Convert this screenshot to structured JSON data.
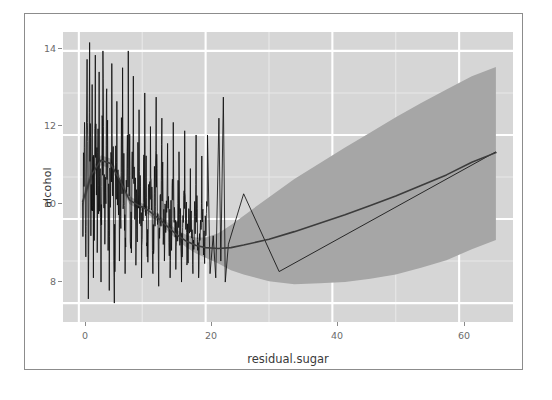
{
  "chart": {
    "axis_titles": {
      "x": "residual.sugar",
      "y": "alcohol"
    },
    "y_ticks": [
      "14",
      "12",
      "10",
      "8"
    ],
    "x_ticks": [
      "0",
      "20",
      "40",
      "60"
    ],
    "colors": {
      "panel_background": "#d6d6d6",
      "grid_major": "#ffffff",
      "grid_minor": "#e8e8e8",
      "data_line": "#111111",
      "smooth_line": "#3c3c3c",
      "confidence_band": "#a6a6a6",
      "axis_text": "#6b6b6b",
      "frame_border": "#8c8c8c"
    }
  },
  "chart_data": {
    "type": "line",
    "title": "",
    "subtitle": "",
    "xlabel": "residual.sugar",
    "ylabel": "alcohol",
    "xlim": [
      -2.5,
      68.5
    ],
    "ylim": [
      7.55,
      14.45
    ],
    "xticks": [
      0,
      20,
      40,
      60
    ],
    "yticks": [
      8,
      10,
      12,
      14
    ],
    "grid": true,
    "legend": "none",
    "annotations": [],
    "series": [
      {
        "name": "alcohol vs residual.sugar (observed, connected)",
        "type": "line",
        "color": "#111111",
        "note": "Dense high-frequency zigzag of ordered observations; amplitude 8.0-14.2 densely packed for residual.sugar 0-20, then sparse isolated spikes to 12.9 near 20-24, then a sparse path peaking 10.6 at x=26, dipping to 8.75 at x=32, then rising steadily to 11.6 at x=65.8",
        "points": [
          [
            0.6,
            10.4
          ],
          [
            0.9,
            12.3
          ],
          [
            1.1,
            9.1
          ],
          [
            1.3,
            13.8
          ],
          [
            1.5,
            8.1
          ],
          [
            1.7,
            14.2
          ],
          [
            1.9,
            9.6
          ],
          [
            2.1,
            13.2
          ],
          [
            2.3,
            8.6
          ],
          [
            2.6,
            13.9
          ],
          [
            2.9,
            9.2
          ],
          [
            3.2,
            13.5
          ],
          [
            3.5,
            8.5
          ],
          [
            3.8,
            14.0
          ],
          [
            4.1,
            9.4
          ],
          [
            4.4,
            13.1
          ],
          [
            4.8,
            8.3
          ],
          [
            5.2,
            13.7
          ],
          [
            5.6,
            8.0
          ],
          [
            6.0,
            12.8
          ],
          [
            6.4,
            9.0
          ],
          [
            6.9,
            13.6
          ],
          [
            7.3,
            8.7
          ],
          [
            7.8,
            14.0
          ],
          [
            8.2,
            9.3
          ],
          [
            8.6,
            13.4
          ],
          [
            9.0,
            8.9
          ],
          [
            9.5,
            12.6
          ],
          [
            9.9,
            8.6
          ],
          [
            10.4,
            13.0
          ],
          [
            10.8,
            9.1
          ],
          [
            11.3,
            12.2
          ],
          [
            11.7,
            8.7
          ],
          [
            12.2,
            12.9
          ],
          [
            12.6,
            8.4
          ],
          [
            13.1,
            12.4
          ],
          [
            13.5,
            9.0
          ],
          [
            14.0,
            11.8
          ],
          [
            14.4,
            8.6
          ],
          [
            14.9,
            12.3
          ],
          [
            15.3,
            8.8
          ],
          [
            15.8,
            11.6
          ],
          [
            16.2,
            8.5
          ],
          [
            16.7,
            12.1
          ],
          [
            17.1,
            9.0
          ],
          [
            17.6,
            11.2
          ],
          [
            18.0,
            8.7
          ],
          [
            18.5,
            12.0
          ],
          [
            18.9,
            8.6
          ],
          [
            19.4,
            11.5
          ],
          [
            19.8,
            9.2
          ],
          [
            20.3,
            12.0
          ],
          [
            20.7,
            8.7
          ],
          [
            21.2,
            9.6
          ],
          [
            21.6,
            8.6
          ],
          [
            22.1,
            12.4
          ],
          [
            22.4,
            9.0
          ],
          [
            22.8,
            12.9
          ],
          [
            23.1,
            8.5
          ],
          [
            23.6,
            9.4
          ],
          [
            26.0,
            10.6
          ],
          [
            31.6,
            8.75
          ],
          [
            65.8,
            11.6
          ]
        ]
      },
      {
        "name": "LOESS smooth (fit)",
        "type": "line",
        "color": "#3c3c3c",
        "x": [
          0.6,
          2.0,
          3.5,
          5.0,
          6.5,
          8.0,
          9.5,
          11.0,
          12.5,
          14.0,
          15.5,
          17.0,
          18.5,
          20.0,
          22.0,
          24.0,
          26.0,
          30.0,
          34.0,
          38.0,
          42.0,
          46.0,
          50.0,
          54.0,
          58.0,
          62.0,
          65.8
        ],
        "y": [
          10.42,
          11.05,
          11.4,
          11.32,
          10.92,
          10.45,
          10.32,
          10.2,
          10.02,
          9.82,
          9.62,
          9.47,
          9.37,
          9.32,
          9.3,
          9.32,
          9.38,
          9.52,
          9.7,
          9.9,
          10.1,
          10.32,
          10.55,
          10.8,
          11.05,
          11.35,
          11.58
        ]
      },
      {
        "name": "95% confidence band (upper)",
        "type": "line",
        "color": "#a6a6a6",
        "x": [
          0.6,
          2.0,
          3.5,
          5.0,
          6.5,
          8.0,
          9.5,
          11.0,
          12.5,
          14.0,
          15.5,
          17.0,
          18.5,
          20.0,
          22.0,
          24.0,
          26.0,
          30.0,
          34.0,
          38.0,
          42.0,
          46.0,
          50.0,
          54.0,
          58.0,
          62.0,
          65.8
        ],
        "y": [
          10.55,
          11.18,
          11.52,
          11.44,
          11.03,
          10.55,
          10.41,
          10.29,
          10.11,
          9.92,
          9.74,
          9.62,
          9.56,
          9.56,
          9.66,
          9.86,
          10.08,
          10.52,
          10.95,
          11.33,
          11.7,
          12.06,
          12.42,
          12.76,
          13.08,
          13.4,
          13.62
        ]
      },
      {
        "name": "95% confidence band (lower)",
        "type": "line",
        "color": "#a6a6a6",
        "x": [
          0.6,
          2.0,
          3.5,
          5.0,
          6.5,
          8.0,
          9.5,
          11.0,
          12.5,
          14.0,
          15.5,
          17.0,
          18.5,
          20.0,
          22.0,
          24.0,
          26.0,
          30.0,
          34.0,
          38.0,
          42.0,
          46.0,
          50.0,
          54.0,
          58.0,
          62.0,
          65.8
        ],
        "y": [
          10.29,
          10.92,
          11.28,
          11.2,
          10.81,
          10.35,
          10.23,
          10.11,
          9.93,
          9.72,
          9.5,
          9.32,
          9.18,
          9.08,
          8.94,
          8.78,
          8.68,
          8.52,
          8.45,
          8.47,
          8.5,
          8.58,
          8.68,
          8.84,
          9.02,
          9.28,
          9.5
        ]
      }
    ]
  }
}
